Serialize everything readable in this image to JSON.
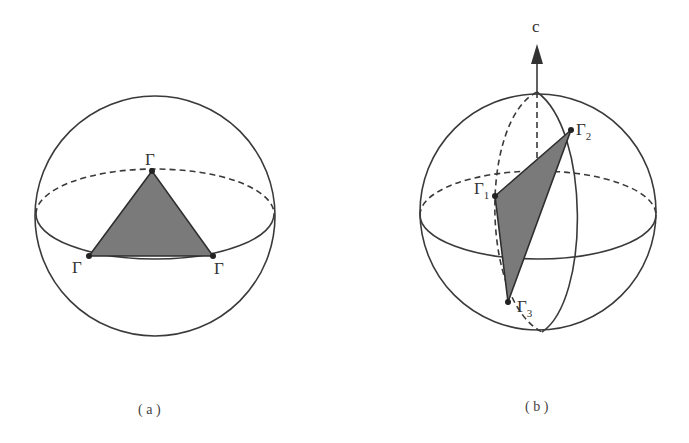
{
  "figure": {
    "panels": [
      {
        "id": "a",
        "caption": "( a )",
        "vertex_labels": [
          "Γ",
          "Γ",
          "Γ"
        ],
        "description": "Sphere with equator; shaded triangle with vertices on the equator"
      },
      {
        "id": "b",
        "caption": "( b )",
        "axis_label": "c",
        "vertex_labels": [
          {
            "symbol": "Γ",
            "subscript": "1"
          },
          {
            "symbol": "Γ",
            "subscript": "2"
          },
          {
            "symbol": "Γ",
            "subscript": "3"
          }
        ],
        "description": "Sphere with equator and meridians, c-axis arrow; shaded tilted triangle"
      }
    ],
    "colors": {
      "line": "#3a3a3a",
      "fill": "#7a7a7a",
      "background": "#ffffff"
    }
  }
}
